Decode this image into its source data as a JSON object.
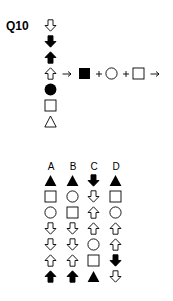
{
  "question": {
    "label": "Q10",
    "sequence": [
      "outline-arrow-down",
      "filled-arrow-down",
      "filled-arrow-up",
      "outline-arrow-up",
      "filled-circle",
      "outline-square",
      "outline-triangle"
    ],
    "rule": {
      "from": "outline-arrow-up",
      "operators": [
        "arrow-right",
        "plus",
        "plus",
        "arrow-right"
      ],
      "items": [
        "filled-square",
        "outline-circle",
        "outline-square"
      ]
    }
  },
  "options": {
    "labels": [
      "A",
      "B",
      "C",
      "D"
    ],
    "columns": [
      [
        "filled-triangle",
        "outline-square",
        "outline-circle",
        "outline-arrow-down",
        "outline-arrow-down",
        "outline-arrow-up",
        "filled-arrow-up"
      ],
      [
        "filled-triangle",
        "outline-circle",
        "outline-square",
        "outline-arrow-down",
        "outline-arrow-down",
        "outline-arrow-up",
        "filled-arrow-up"
      ],
      [
        "filled-arrow-down",
        "outline-arrow-down",
        "outline-arrow-up",
        "outline-arrow-up",
        "outline-circle",
        "outline-square",
        "filled-triangle"
      ],
      [
        "filled-triangle",
        "outline-square",
        "outline-circle",
        "outline-arrow-up",
        "outline-arrow-up",
        "filled-arrow-down",
        "outline-arrow-down"
      ]
    ]
  }
}
